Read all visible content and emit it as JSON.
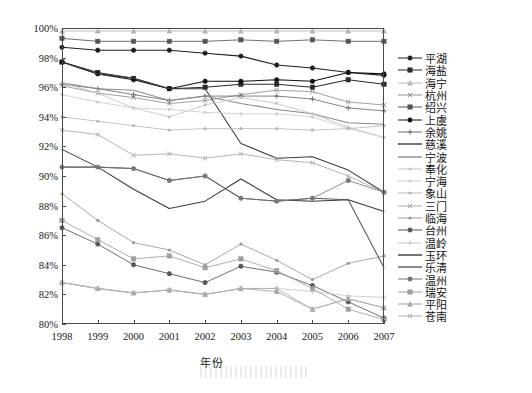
{
  "chart_data": {
    "type": "line",
    "title": "",
    "xlabel": "年份",
    "ylabel": "",
    "x": [
      "1998",
      "1999",
      "2000",
      "2001",
      "2002",
      "2003",
      "2004",
      "2005",
      "2006",
      "2007"
    ],
    "categories": [
      "1998",
      "1999",
      "2000",
      "2001",
      "2002",
      "2003",
      "2004",
      "2005",
      "2006",
      "2007"
    ],
    "ylim": [
      80,
      100
    ],
    "xlim": [
      "1998",
      "2007"
    ],
    "ytick_labels": [
      "80%",
      "82%",
      "84%",
      "86%",
      "88%",
      "90%",
      "92%",
      "94%",
      "96%",
      "98%",
      "100%"
    ],
    "ytick_values": [
      80,
      82,
      84,
      86,
      88,
      90,
      92,
      94,
      96,
      98,
      100
    ],
    "grid": false,
    "legend_position": "right",
    "y_unit": "%",
    "series": [
      {
        "name": "平湖",
        "color": "#1f1f1f",
        "marker": "circle",
        "values": [
          98.7,
          98.5,
          98.5,
          98.5,
          98.3,
          98.1,
          97.5,
          97.3,
          97.0,
          96.8
        ]
      },
      {
        "name": "海盐",
        "color": "#2b2b2b",
        "marker": "square",
        "values": [
          97.7,
          97.0,
          96.6,
          95.9,
          96.0,
          96.2,
          96.2,
          96.0,
          96.5,
          96.2
        ]
      },
      {
        "name": "海宁",
        "color": "#b4b4b4",
        "marker": "triangle",
        "values": [
          99.8,
          99.8,
          99.8,
          99.8,
          99.8,
          99.8,
          99.8,
          99.8,
          99.8,
          99.8
        ]
      },
      {
        "name": "杭州",
        "color": "#909090",
        "marker": "cross",
        "values": [
          96.1,
          95.6,
          95.3,
          94.9,
          95.1,
          95.5,
          95.8,
          95.7,
          95.0,
          94.8
        ]
      },
      {
        "name": "绍兴",
        "color": "#555555",
        "marker": "square",
        "values": [
          99.3,
          99.1,
          99.1,
          99.1,
          99.1,
          99.2,
          99.1,
          99.2,
          99.1,
          99.1
        ]
      },
      {
        "name": "上虞",
        "color": "#111111",
        "marker": "circle-filled",
        "values": [
          97.7,
          96.9,
          96.5,
          95.9,
          96.4,
          96.4,
          96.5,
          96.4,
          97.0,
          96.9
        ]
      },
      {
        "name": "余姚",
        "color": "#6e6e6e",
        "marker": "plus",
        "values": [
          96.2,
          95.9,
          95.5,
          95.1,
          95.4,
          95.4,
          95.4,
          95.2,
          94.6,
          94.4
        ]
      },
      {
        "name": "慈溪",
        "color": "#3c3c3c",
        "marker": "none",
        "values": [
          97.7,
          96.9,
          96.6,
          95.9,
          95.9,
          92.2,
          91.2,
          91.3,
          90.4,
          88.9
        ]
      },
      {
        "name": "宁波",
        "color": "#8a8a8a",
        "marker": "none",
        "values": [
          96.3,
          95.9,
          95.8,
          95.1,
          95.4,
          94.9,
          94.5,
          94.2,
          93.6,
          93.5
        ]
      },
      {
        "name": "奉化",
        "color": "#c2c2c2",
        "marker": "dot",
        "values": [
          96.3,
          95.6,
          94.6,
          94.0,
          94.8,
          95.3,
          94.9,
          94.2,
          93.3,
          92.6
        ]
      },
      {
        "name": "宁海",
        "color": "#cccccc",
        "marker": "dot",
        "values": [
          95.5,
          95.0,
          94.6,
          94.5,
          94.3,
          94.2,
          94.2,
          94.0,
          93.2,
          92.6
        ]
      },
      {
        "name": "象山",
        "color": "#b8b8b8",
        "marker": "dot",
        "values": [
          94.0,
          93.7,
          93.4,
          93.1,
          93.2,
          93.2,
          93.2,
          93.1,
          93.2,
          93.4
        ]
      },
      {
        "name": "三门",
        "color": "#a8a8a8",
        "marker": "cross",
        "values": [
          93.1,
          92.8,
          91.4,
          91.5,
          91.2,
          91.5,
          91.1,
          90.9,
          90.0,
          88.9
        ]
      },
      {
        "name": "临海",
        "color": "#9a9a9a",
        "marker": "dot",
        "values": [
          88.8,
          87.0,
          85.5,
          85.0,
          84.0,
          85.4,
          84.3,
          83.0,
          84.1,
          84.6
        ]
      },
      {
        "name": "台州",
        "color": "#555555",
        "marker": "circle",
        "values": [
          86.5,
          85.4,
          84.0,
          83.4,
          82.8,
          83.9,
          83.5,
          82.6,
          81.5,
          80.4
        ]
      },
      {
        "name": "温岭",
        "color": "#c8c8c8",
        "marker": "plus",
        "values": [
          82.8,
          82.4,
          82.1,
          82.3,
          82.0,
          82.4,
          82.4,
          82.2,
          81.9,
          81.8
        ]
      },
      {
        "name": "玉环",
        "color": "#3a3a3a",
        "marker": "none",
        "values": [
          91.8,
          90.6,
          89.1,
          87.8,
          88.3,
          89.8,
          88.4,
          88.3,
          88.4,
          87.6
        ]
      },
      {
        "name": "乐清",
        "color": "#565656",
        "marker": "none",
        "values": [
          90.6,
          90.6,
          90.5,
          89.7,
          90.0,
          88.5,
          88.3,
          88.5,
          88.4,
          83.8
        ]
      },
      {
        "name": "温州",
        "color": "#767676",
        "marker": "circle",
        "values": [
          90.6,
          90.6,
          90.5,
          89.7,
          90.0,
          88.5,
          88.3,
          88.5,
          89.7,
          88.9
        ]
      },
      {
        "name": "瑞安",
        "color": "#9e9e9e",
        "marker": "square",
        "values": [
          87.0,
          85.7,
          84.4,
          84.6,
          83.8,
          84.4,
          83.6,
          82.4,
          81.0,
          80.3
        ]
      },
      {
        "name": "平阳",
        "color": "#a0a0a0",
        "marker": "triangle",
        "values": [
          82.8,
          82.4,
          82.1,
          82.3,
          82.0,
          82.4,
          82.2,
          81.0,
          81.7,
          81.1
        ]
      },
      {
        "name": "苍南",
        "color": "#b0b0b0",
        "marker": "cross",
        "values": [
          82.8,
          82.4,
          82.1,
          82.3,
          82.0,
          82.4,
          82.4,
          81.0,
          81.7,
          81.1
        ]
      }
    ]
  },
  "axes": {
    "x_title": "年份"
  }
}
